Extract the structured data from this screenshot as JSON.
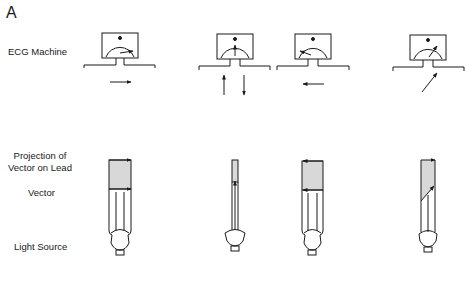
{
  "panel": {
    "label": "A"
  },
  "row_labels": {
    "ecg_machine": "ECG Machine",
    "projection_line1": "Projection of",
    "projection_line2": "Vector on Lead",
    "vector": "Vector",
    "light_source": "Light Source"
  },
  "meter_scale": {
    "zero": "0",
    "minus": "–",
    "plus": "+"
  },
  "columns": [
    {
      "id": "1",
      "vector_direction": "parallel-positive",
      "meter_deflection": "maximum-positive",
      "lead_arrow": "right"
    },
    {
      "id": "2",
      "vector_direction": "perpendicular",
      "meter_deflection": "zero",
      "lead_arrow": "up-and-down"
    },
    {
      "id": "3",
      "vector_direction": "parallel-negative",
      "meter_deflection": "maximum-negative",
      "lead_arrow": "left"
    },
    {
      "id": "4",
      "vector_direction": "oblique-positive",
      "meter_deflection": "partial-positive",
      "lead_arrow": "diagonal-up-right"
    }
  ]
}
